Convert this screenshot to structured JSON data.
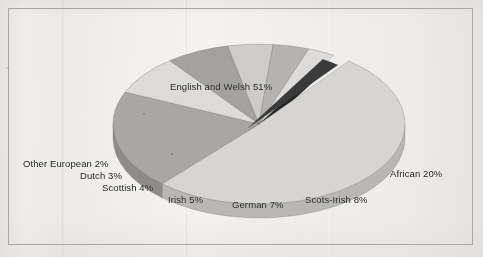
{
  "figure": {
    "background_color": "#efeeec",
    "border_color": "#a9a8a5",
    "label_color": "#1d1d1d"
  },
  "chart_data": {
    "type": "pie",
    "title": "",
    "subtitle": "",
    "xlabel": "",
    "ylabel": "",
    "legend_position": "none",
    "grid": false,
    "three_d": true,
    "units": "percent",
    "total": 100,
    "categories": [
      "English and Welsh",
      "African",
      "Scots-Irish",
      "German",
      "Irish",
      "Scottish",
      "Dutch",
      "Other European"
    ],
    "values": [
      51,
      20,
      8,
      7,
      5,
      4,
      3,
      2
    ],
    "slices": [
      {
        "name": "English and Welsh",
        "value": 51,
        "label": "English and Welsh 51%",
        "color": "#d7d6d3",
        "side_color": "#b9b8b5",
        "exploded": false
      },
      {
        "name": "African",
        "value": 20,
        "label": "African 20%",
        "color": "#a9a8a5",
        "side_color": "#8e8d8a",
        "exploded": false
      },
      {
        "name": "Scots-Irish",
        "value": 8,
        "label": "Scots-Irish 8%",
        "color": "#dddcd9",
        "side_color": "#bfbebb",
        "exploded": false
      },
      {
        "name": "German",
        "value": 7,
        "label": "German 7%",
        "color": "#a4a3a0",
        "side_color": "#8a8986",
        "exploded": false
      },
      {
        "name": "Irish",
        "value": 5,
        "label": "Irish 5%",
        "color": "#cecdca",
        "side_color": "#b2b1ae",
        "exploded": false
      },
      {
        "name": "Scottish",
        "value": 4,
        "label": "Scottish 4%",
        "color": "#b5b4b1",
        "side_color": "#9a9996",
        "exploded": false
      },
      {
        "name": "Dutch",
        "value": 3,
        "label": "Dutch 3%",
        "color": "#dedddb",
        "side_color": "#c0bfbc",
        "exploded": false
      },
      {
        "name": "Other European",
        "value": 2,
        "label": "Other European 2%",
        "color": "#3a3a3a",
        "side_color": "#262626",
        "exploded": true
      }
    ]
  },
  "labels": {
    "english_and_welsh": "English and Welsh 51%",
    "african": "African 20%",
    "scots_irish": "Scots-Irish 8%",
    "german": "German 7%",
    "irish": "Irish 5%",
    "scottish": "Scottish 4%",
    "dutch": "Dutch 3%",
    "other_european": "Other European 2%"
  }
}
